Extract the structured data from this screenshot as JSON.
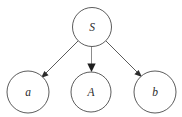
{
  "diagram": {
    "type": "directed-graph",
    "background_color": "#ffffff",
    "stroke_color": "#4a4a4a",
    "arrow_color": "#2b2b2b",
    "label_color": "#2b2b2b",
    "stroke_width": 0.9,
    "nodes": [
      {
        "id": "S",
        "label": "S",
        "cx": 92,
        "cy": 27,
        "r": 19.5,
        "role": "root"
      },
      {
        "id": "a",
        "label": "a",
        "cx": 28,
        "cy": 92,
        "r": 21,
        "role": "leaf"
      },
      {
        "id": "A",
        "label": "A",
        "cx": 91,
        "cy": 92,
        "r": 20,
        "role": "leaf"
      },
      {
        "id": "b",
        "label": "b",
        "cx": 155,
        "cy": 92,
        "r": 21,
        "role": "leaf"
      }
    ],
    "edges": [
      {
        "id": "S-a",
        "from": "S",
        "to": "a",
        "x1": 78,
        "y1": 41,
        "x2": 41,
        "y2": 78,
        "arrow": true
      },
      {
        "id": "S-A",
        "from": "S",
        "to": "A",
        "x1": 91.5,
        "y1": 46.5,
        "x2": 91.5,
        "y2": 70,
        "arrow": true
      },
      {
        "id": "S-b",
        "from": "S",
        "to": "b",
        "x1": 106,
        "y1": 41,
        "x2": 142,
        "y2": 77,
        "arrow": true
      }
    ]
  }
}
